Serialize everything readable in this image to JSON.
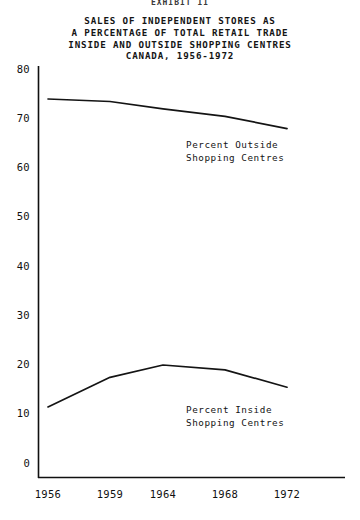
{
  "exhibit_header": "EXHIBIT II",
  "title_lines": [
    "SALES OF INDEPENDENT STORES AS",
    "A PERCENTAGE OF TOTAL RETAIL TRADE",
    "INSIDE AND OUTSIDE SHOPPING CENTRES",
    "CANADA, 1956-1972"
  ],
  "labels": {
    "outside": [
      "Percent Outside",
      "Shopping Centres"
    ],
    "inside": [
      "Percent Inside",
      "Shopping Centres"
    ]
  },
  "colors": {
    "line": "#141414",
    "axis": "#101010",
    "background": "#ffffff"
  },
  "chart_data": {
    "type": "line",
    "title": "SALES OF INDEPENDENT STORES AS A PERCENTAGE OF TOTAL RETAIL TRADE INSIDE AND OUTSIDE SHOPPING CENTRES CANADA, 1956-1972",
    "xlabel": "",
    "ylabel": "",
    "x": [
      1956,
      1959,
      1964,
      1968,
      1972
    ],
    "xticklabels": [
      "1956",
      "1959",
      "1964",
      "1968",
      "1972"
    ],
    "yticks": [
      0,
      10,
      20,
      30,
      40,
      50,
      60,
      70,
      80
    ],
    "yticklabels": [
      "0",
      "10",
      "20",
      "30",
      "40",
      "50",
      "60",
      "70",
      "80"
    ],
    "ylim": [
      0,
      80
    ],
    "grid": false,
    "legend": "inline-annotations",
    "series": [
      {
        "name": "Percent Outside Shopping Centres",
        "values": [
          74,
          73.5,
          72,
          70.5,
          68
        ]
      },
      {
        "name": "Percent Inside Shopping Centres",
        "values": [
          11.5,
          17.5,
          20,
          19,
          15.5
        ]
      }
    ]
  }
}
